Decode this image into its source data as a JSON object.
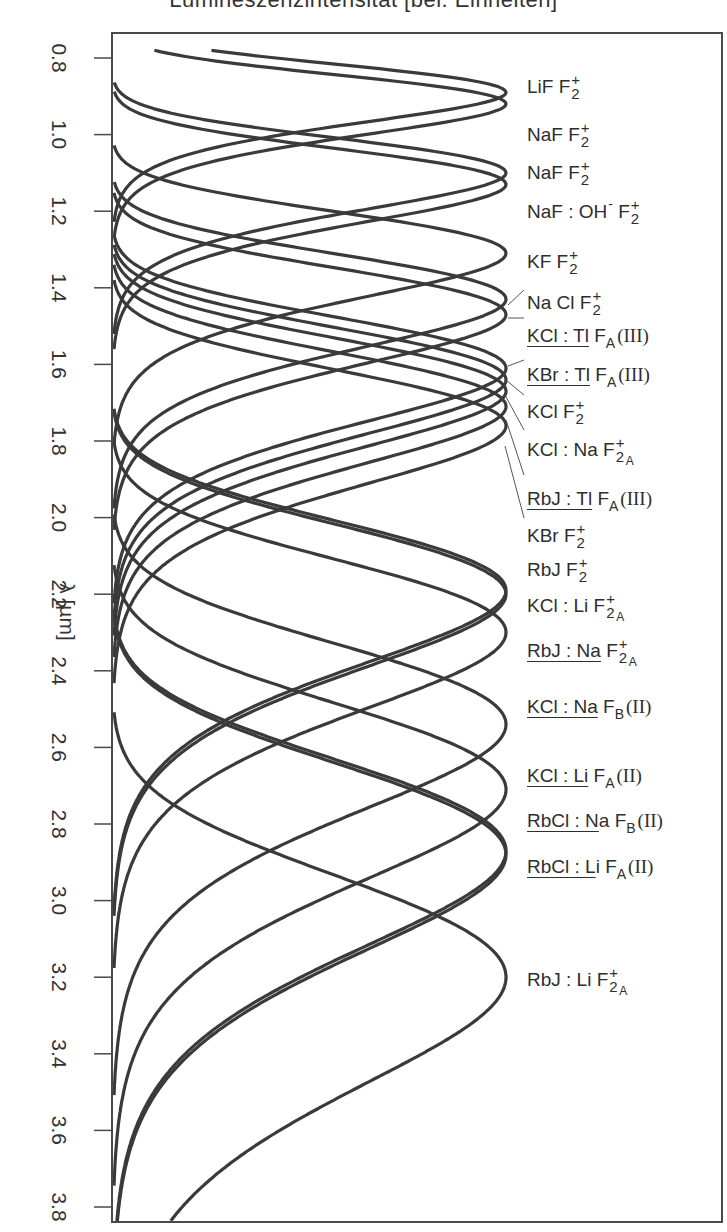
{
  "chart_data": {
    "type": "line",
    "orientation": "vertical-wavelength-axis",
    "title": "Lumineszenzintensität [bel. Einheiten]",
    "xlabel": "Lumineszenzintensität [bel. Einheiten]",
    "ylabel": "λ [µm]",
    "ylim": [
      0.8,
      3.8
    ],
    "yticks": [
      "0.8",
      "1.0",
      "1.2",
      "1.4",
      "1.6",
      "1.8",
      "2.0",
      "2.2",
      "2.4",
      "2.6",
      "2.8",
      "3.0",
      "3.2",
      "3.4",
      "3.6",
      "3.8"
    ],
    "grid": false,
    "legend": "inline labels at right of each band peak",
    "series": [
      {
        "name": "LiF F2+",
        "peak_um": 0.89,
        "rel_intensity": 1.0
      },
      {
        "name": "NaF F2+",
        "peak_um": 0.92,
        "rel_intensity": 1.0
      },
      {
        "name": "NaF F2+",
        "peak_um": 1.1,
        "rel_intensity": 1.0
      },
      {
        "name": "NaF : OH- F2+",
        "peak_um": 1.13,
        "rel_intensity": 1.0
      },
      {
        "name": "KF F2+",
        "peak_um": 1.31,
        "rel_intensity": 1.0
      },
      {
        "name": "Na Cl F2+",
        "peak_um": 1.43,
        "rel_intensity": 1.0
      },
      {
        "name": "KCl : Tl FA(III)",
        "peak_um": 1.47,
        "rel_intensity": 1.0
      },
      {
        "name": "KBr : Tl FA(III)",
        "peak_um": 1.61,
        "rel_intensity": 1.0
      },
      {
        "name": "KCl F2+",
        "peak_um": 1.64,
        "rel_intensity": 1.0
      },
      {
        "name": "KCl : Na F2A+",
        "peak_um": 1.67,
        "rel_intensity": 1.0
      },
      {
        "name": "RbJ : Tl FA(III)",
        "peak_um": 1.71,
        "rel_intensity": 1.0
      },
      {
        "name": "KBr F2+",
        "peak_um": 1.76,
        "rel_intensity": 1.0
      },
      {
        "name": "RbJ F2+",
        "peak_um": 2.19,
        "rel_intensity": 1.0
      },
      {
        "name": "KCl : Li F2A+",
        "peak_um": 2.2,
        "rel_intensity": 1.0
      },
      {
        "name": "RbJ : Na F2A+",
        "peak_um": 2.3,
        "rel_intensity": 1.0
      },
      {
        "name": "KCl : Na FB(II)",
        "peak_um": 2.54,
        "rel_intensity": 1.0
      },
      {
        "name": "KCl : Li FA(II)",
        "peak_um": 2.71,
        "rel_intensity": 1.0
      },
      {
        "name": "RbCl : Na FB(II)",
        "peak_um": 2.87,
        "rel_intensity": 1.0
      },
      {
        "name": "RbCl : Li FA(II)",
        "peak_um": 2.88,
        "rel_intensity": 1.0
      },
      {
        "name": "RbJ : Li F2A+",
        "peak_um": 3.2,
        "rel_intensity": 1.0
      }
    ]
  },
  "plot": {
    "frame": {
      "left": 112,
      "top": 33,
      "right": 722,
      "bottom": 1222
    },
    "axis_map": {
      "y_at_0_8": 58,
      "y_at_3_8": 1207
    },
    "peak_x": 506,
    "base_x": 112,
    "curve_color": "#3a3a3a"
  },
  "labels": [
    {
      "id": "lif-f2",
      "top": 77,
      "parts": [
        {
          "t": "LiF  F"
        },
        {
          "supsub": [
            "+",
            "2"
          ]
        }
      ]
    },
    {
      "id": "naf-f2-a",
      "top": 125,
      "parts": [
        {
          "t": "NaF  F"
        },
        {
          "supsub": [
            "+",
            "2"
          ]
        }
      ]
    },
    {
      "id": "naf-f2-b",
      "top": 163,
      "parts": [
        {
          "t": "NaF  F"
        },
        {
          "supsub": [
            "+",
            "2"
          ]
        }
      ]
    },
    {
      "id": "naf-oh-f2",
      "top": 202,
      "parts": [
        {
          "t": "NaF : OH"
        },
        {
          "sup": "-"
        },
        {
          "t": " F"
        },
        {
          "supsub": [
            "+",
            "2"
          ]
        }
      ]
    },
    {
      "id": "kf-f2",
      "top": 252,
      "parts": [
        {
          "t": "KF  F"
        },
        {
          "supsub": [
            "+",
            "2"
          ]
        }
      ]
    },
    {
      "id": "nacl-f2",
      "top": 293,
      "parts": [
        {
          "t": "Na Cl F"
        },
        {
          "supsub": [
            "+",
            "2"
          ]
        }
      ]
    },
    {
      "id": "kcl-tl-fa",
      "top": 326,
      "parts": [
        {
          "u": "KCl : Tl"
        },
        {
          "t": " F"
        },
        {
          "sub": "A"
        },
        {
          "paren": "(III)"
        }
      ]
    },
    {
      "id": "kbr-tl-fa",
      "top": 365,
      "parts": [
        {
          "u": "KBr : Tl"
        },
        {
          "t": " F"
        },
        {
          "sub": "A"
        },
        {
          "paren": "(III)"
        }
      ]
    },
    {
      "id": "kcl-f2",
      "top": 402,
      "parts": [
        {
          "t": "KCl  F"
        },
        {
          "supsub": [
            "+",
            "2"
          ]
        }
      ]
    },
    {
      "id": "kcl-na-f2a",
      "top": 440,
      "parts": [
        {
          "t": "KCl : Na F"
        },
        {
          "supsub3": [
            "+",
            "2",
            "A"
          ]
        }
      ]
    },
    {
      "id": "rbj-tl-fa",
      "top": 489,
      "parts": [
        {
          "u": "RbJ : Tl"
        },
        {
          "t": " F"
        },
        {
          "sub": "A"
        },
        {
          "paren": "(III)"
        }
      ]
    },
    {
      "id": "kbr-f2",
      "top": 526,
      "parts": [
        {
          "t": "KBr F"
        },
        {
          "supsub": [
            "+",
            "2"
          ]
        }
      ]
    },
    {
      "id": "rbj-f2",
      "top": 560,
      "parts": [
        {
          "t": "RbJ  F"
        },
        {
          "supsub": [
            "+",
            "2"
          ]
        }
      ]
    },
    {
      "id": "kcl-li-f2a",
      "top": 596,
      "parts": [
        {
          "t": "KCl : Li F"
        },
        {
          "supsub3": [
            "+",
            "2",
            "A"
          ]
        }
      ]
    },
    {
      "id": "rbj-na-f2a",
      "top": 641,
      "parts": [
        {
          "u": "RbJ : Na"
        },
        {
          "t": " F"
        },
        {
          "supsub3": [
            "+",
            "2",
            "A"
          ]
        }
      ]
    },
    {
      "id": "kcl-na-fb",
      "top": 697,
      "parts": [
        {
          "u": "KCl : Na"
        },
        {
          "t": " F"
        },
        {
          "sub": "B"
        },
        {
          "paren": "(II)"
        }
      ]
    },
    {
      "id": "kcl-li-fa",
      "top": 766,
      "parts": [
        {
          "u": "KCl : Li"
        },
        {
          "t": " F"
        },
        {
          "sub": "A"
        },
        {
          "paren": "(II)"
        }
      ]
    },
    {
      "id": "rbcl-na-fb",
      "top": 811,
      "parts": [
        {
          "u": "RbCl : N"
        },
        {
          "t": "a F"
        },
        {
          "sub": "B"
        },
        {
          "paren": "(II)"
        }
      ]
    },
    {
      "id": "rbcl-li-fa",
      "top": 857,
      "parts": [
        {
          "u": "RbCl : L"
        },
        {
          "t": "i F"
        },
        {
          "sub": "A"
        },
        {
          "paren": "(II)"
        }
      ]
    },
    {
      "id": "rbj-li-f2a",
      "top": 970,
      "parts": [
        {
          "t": "RbJ : Li F"
        },
        {
          "supsub3": [
            "+",
            "2",
            "A"
          ]
        }
      ]
    }
  ],
  "leaders": [
    {
      "from": [
        508,
        305
      ],
      "to": [
        524,
        290
      ]
    },
    {
      "from": [
        508,
        318
      ],
      "to": [
        524,
        318
      ]
    },
    {
      "from": [
        508,
        366
      ],
      "to": [
        524,
        360
      ]
    },
    {
      "from": [
        506,
        380
      ],
      "to": [
        524,
        395
      ]
    },
    {
      "from": [
        505,
        395
      ],
      "to": [
        524,
        430
      ]
    },
    {
      "from": [
        506,
        420
      ],
      "to": [
        524,
        475
      ]
    },
    {
      "from": [
        505,
        446
      ],
      "to": [
        524,
        518
      ]
    }
  ]
}
